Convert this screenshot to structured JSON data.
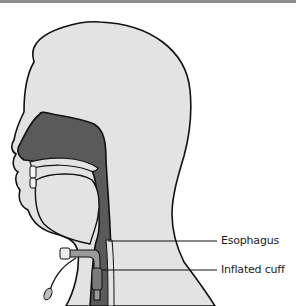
{
  "figure": {
    "colors": {
      "skin": "#e3e3e3",
      "airway": "#5a5a5a",
      "outline": "#111111",
      "background": "#ffffff",
      "top_rule": "#8e8e8e"
    }
  },
  "labels": {
    "esophagus": "Esophagus",
    "inflated_cuff": "Inflated cuff"
  }
}
